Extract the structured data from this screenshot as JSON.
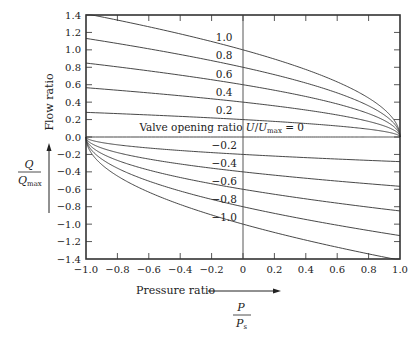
{
  "chart_data": {
    "type": "line",
    "title": "",
    "xlabel": "Pressure ratio",
    "xlabel_fraction": {
      "numerator": "P",
      "denominator": "P",
      "denominator_sub": "s"
    },
    "ylabel": "Flow ratio",
    "ylabel_fraction": {
      "numerator": "Q",
      "denominator": "Q",
      "denominator_sub": "max"
    },
    "xlim": [
      -1.0,
      1.0
    ],
    "ylim": [
      -1.4,
      1.4
    ],
    "xticks": [
      "-1.0",
      "-0.8",
      "-0.6",
      "-0.4",
      "-0.2",
      "0",
      "0.2",
      "0.4",
      "0.6",
      "0.8",
      "1.0"
    ],
    "xtick_values": [
      -1.0,
      -0.8,
      -0.6,
      -0.4,
      -0.2,
      0,
      0.2,
      0.4,
      0.6,
      0.8,
      1.0
    ],
    "yticks": [
      "1.4",
      "1.2",
      "1.0",
      "0.8",
      "0.6",
      "0.4",
      "0.2",
      "0.0",
      "-0.2",
      "-0.4",
      "-0.6",
      "-0.8",
      "-1.0",
      "-1.2",
      "-1.4"
    ],
    "ytick_values": [
      1.4,
      1.2,
      1.0,
      0.8,
      0.6,
      0.4,
      0.2,
      0.0,
      -0.2,
      -0.4,
      -0.6,
      -0.8,
      -1.0,
      -1.2,
      -1.4
    ],
    "grid": false,
    "zero_line_vertical": true,
    "relationship": "Q/Qmax = U/Umax * sqrt(1 - P/Ps) for U>=0; Q/Qmax = U/Umax * sqrt(1 + P/Ps) for U<0",
    "zero_curve_label": "Valve opening ratio U/Umax = 0",
    "zero_curve_label_parts": {
      "prefix": "Valve opening ratio ",
      "var": "U",
      "slash": "/",
      "var2": "U",
      "sub": "max",
      "suffix": " = 0"
    },
    "series": [
      {
        "name": "1.0",
        "u": 1.0,
        "points": [
          [
            -1.0,
            1.414
          ],
          [
            -0.5,
            1.225
          ],
          [
            0,
            1.0
          ],
          [
            0.5,
            0.707
          ],
          [
            0.8,
            0.447
          ],
          [
            1.0,
            0.0
          ]
        ]
      },
      {
        "name": "0.8",
        "u": 0.8,
        "points": [
          [
            -1.0,
            1.131
          ],
          [
            -0.5,
            0.98
          ],
          [
            0,
            0.8
          ],
          [
            0.5,
            0.566
          ],
          [
            0.8,
            0.358
          ],
          [
            1.0,
            0.0
          ]
        ]
      },
      {
        "name": "0.6",
        "u": 0.6,
        "points": [
          [
            -1.0,
            0.849
          ],
          [
            -0.5,
            0.735
          ],
          [
            0,
            0.6
          ],
          [
            0.5,
            0.424
          ],
          [
            0.8,
            0.268
          ],
          [
            1.0,
            0.0
          ]
        ]
      },
      {
        "name": "0.4",
        "u": 0.4,
        "points": [
          [
            -1.0,
            0.566
          ],
          [
            -0.5,
            0.49
          ],
          [
            0,
            0.4
          ],
          [
            0.5,
            0.283
          ],
          [
            0.8,
            0.179
          ],
          [
            1.0,
            0.0
          ]
        ]
      },
      {
        "name": "0.2",
        "u": 0.2,
        "points": [
          [
            -1.0,
            0.283
          ],
          [
            -0.5,
            0.245
          ],
          [
            0,
            0.2
          ],
          [
            0.5,
            0.141
          ],
          [
            0.8,
            0.089
          ],
          [
            1.0,
            0.0
          ]
        ]
      },
      {
        "name": "0",
        "u": 0.0,
        "points": [
          [
            -1.0,
            0.0
          ],
          [
            1.0,
            0.0
          ]
        ]
      },
      {
        "name": "-0.2",
        "u": -0.2,
        "points": [
          [
            -1.0,
            0.0
          ],
          [
            -0.8,
            -0.089
          ],
          [
            -0.5,
            -0.141
          ],
          [
            0,
            -0.2
          ],
          [
            0.5,
            -0.245
          ],
          [
            1.0,
            -0.283
          ]
        ]
      },
      {
        "name": "-0.4",
        "u": -0.4,
        "points": [
          [
            -1.0,
            0.0
          ],
          [
            -0.8,
            -0.179
          ],
          [
            -0.5,
            -0.283
          ],
          [
            0,
            -0.4
          ],
          [
            0.5,
            -0.49
          ],
          [
            1.0,
            -0.566
          ]
        ]
      },
      {
        "name": "-0.6",
        "u": -0.6,
        "points": [
          [
            -1.0,
            0.0
          ],
          [
            -0.8,
            -0.268
          ],
          [
            -0.5,
            -0.424
          ],
          [
            0,
            -0.6
          ],
          [
            0.5,
            -0.735
          ],
          [
            1.0,
            -0.849
          ]
        ]
      },
      {
        "name": "-0.8",
        "u": -0.8,
        "points": [
          [
            -1.0,
            0.0
          ],
          [
            -0.8,
            -0.358
          ],
          [
            -0.5,
            -0.566
          ],
          [
            0,
            -0.8
          ],
          [
            0.5,
            -0.98
          ],
          [
            1.0,
            -1.131
          ]
        ]
      },
      {
        "name": "-1.0",
        "u": -1.0,
        "points": [
          [
            -1.0,
            0.0
          ],
          [
            -0.8,
            -0.447
          ],
          [
            -0.5,
            -0.707
          ],
          [
            0,
            -1.0
          ],
          [
            0.5,
            -1.225
          ],
          [
            1.0,
            -1.414
          ]
        ]
      }
    ],
    "curve_labels": [
      {
        "text": "1.0",
        "x": -0.12,
        "y": 1.1
      },
      {
        "text": "0.8",
        "x": -0.12,
        "y": 0.89
      },
      {
        "text": "0.6",
        "x": -0.12,
        "y": 0.68
      },
      {
        "text": "0.4",
        "x": -0.12,
        "y": 0.47
      },
      {
        "text": "0.2",
        "x": -0.12,
        "y": 0.26
      },
      {
        "text": "-0.2",
        "x": -0.12,
        "y": -0.14
      },
      {
        "text": "-0.4",
        "x": -0.12,
        "y": -0.34
      },
      {
        "text": "-0.6",
        "x": -0.12,
        "y": -0.55
      },
      {
        "text": "-0.8",
        "x": -0.12,
        "y": -0.76
      },
      {
        "text": "-1.0",
        "x": -0.12,
        "y": -0.96
      }
    ]
  }
}
